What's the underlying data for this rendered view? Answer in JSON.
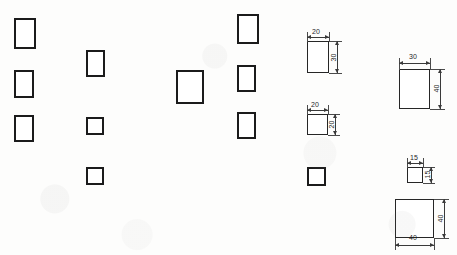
{
  "sheet": {
    "title": "Technical Drawing Worksheet",
    "width": 457,
    "height": 255,
    "background_color": "#fdfdfc",
    "stroke_color": "#1b1b1b",
    "dimension_color": "#3a3a3a",
    "units_note": ""
  },
  "plain_shapes": [
    {
      "id": "shape-1",
      "label": "rectangle",
      "x": 14,
      "y": 18,
      "w": 22,
      "h": 31
    },
    {
      "id": "shape-2",
      "label": "rectangle",
      "x": 14,
      "y": 70,
      "w": 20,
      "h": 28
    },
    {
      "id": "shape-3",
      "label": "rectangle",
      "x": 14,
      "y": 115,
      "w": 20,
      "h": 27
    },
    {
      "id": "shape-4",
      "label": "rectangle",
      "x": 86,
      "y": 50,
      "w": 19,
      "h": 27
    },
    {
      "id": "shape-5",
      "label": "square",
      "x": 86,
      "y": 117,
      "w": 18,
      "h": 18
    },
    {
      "id": "shape-6",
      "label": "square",
      "x": 86,
      "y": 167,
      "w": 18,
      "h": 18
    },
    {
      "id": "shape-7",
      "label": "rectangle",
      "x": 176,
      "y": 70,
      "w": 28,
      "h": 34
    },
    {
      "id": "shape-8",
      "label": "rectangle",
      "x": 237,
      "y": 14,
      "w": 22,
      "h": 30
    },
    {
      "id": "shape-9",
      "label": "rectangle",
      "x": 237,
      "y": 65,
      "w": 19,
      "h": 27
    },
    {
      "id": "shape-10",
      "label": "rectangle",
      "x": 237,
      "y": 112,
      "w": 19,
      "h": 27
    },
    {
      "id": "shape-11",
      "label": "square",
      "x": 307,
      "y": 167,
      "w": 19,
      "h": 19
    }
  ],
  "dimensioned_shapes": [
    {
      "id": "dim-shape-1",
      "label": "rectangle-20x30",
      "x": 307,
      "y": 41,
      "w": 22,
      "h": 32,
      "top_value": "20",
      "right_value": "30"
    },
    {
      "id": "dim-shape-2",
      "label": "square-20x20",
      "x": 307,
      "y": 114,
      "w": 21,
      "h": 21,
      "top_value": "20",
      "right_value": "20"
    },
    {
      "id": "dim-shape-3",
      "label": "rectangle-30x40",
      "x": 399,
      "y": 69,
      "w": 31,
      "h": 40,
      "top_value": "30",
      "right_value": "40"
    },
    {
      "id": "dim-shape-4",
      "label": "square-15x15",
      "x": 407,
      "y": 167,
      "w": 16,
      "h": 16,
      "top_value": "15",
      "right_value": "15"
    },
    {
      "id": "dim-shape-5",
      "label": "square-40x40",
      "x": 395,
      "y": 199,
      "w": 39,
      "h": 39,
      "top_value": "",
      "right_value": "40",
      "bottom_value": "40"
    }
  ]
}
